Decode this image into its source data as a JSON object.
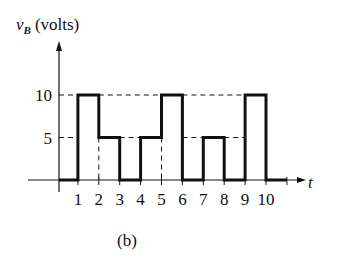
{
  "chart_data": {
    "type": "line",
    "subtype": "step",
    "title": "",
    "ylabel": "v_B (volts)",
    "ylabel_var": "v",
    "ylabel_sub": "B",
    "ylabel_unit": "(volts)",
    "xlabel": "t",
    "caption": "(b)",
    "x_ticks": [
      1,
      2,
      3,
      4,
      5,
      6,
      7,
      8,
      9,
      10
    ],
    "y_ticks": [
      5,
      10
    ],
    "ylim": [
      0,
      10
    ],
    "xlim": [
      0,
      11
    ],
    "segments": [
      {
        "t_start": 0,
        "t_end": 1,
        "value": 0
      },
      {
        "t_start": 1,
        "t_end": 2,
        "value": 10
      },
      {
        "t_start": 2,
        "t_end": 3,
        "value": 5
      },
      {
        "t_start": 3,
        "t_end": 4,
        "value": 0
      },
      {
        "t_start": 4,
        "t_end": 5,
        "value": 5
      },
      {
        "t_start": 5,
        "t_end": 6,
        "value": 10
      },
      {
        "t_start": 6,
        "t_end": 7,
        "value": 0
      },
      {
        "t_start": 7,
        "t_end": 8,
        "value": 5
      },
      {
        "t_start": 8,
        "t_end": 9,
        "value": 0
      },
      {
        "t_start": 9,
        "t_end": 10,
        "value": 10
      },
      {
        "t_start": 10,
        "t_end": 11,
        "value": 0
      }
    ],
    "grid": false,
    "legend": null
  },
  "colors": {
    "ink": "#111111",
    "background": "#ffffff"
  }
}
